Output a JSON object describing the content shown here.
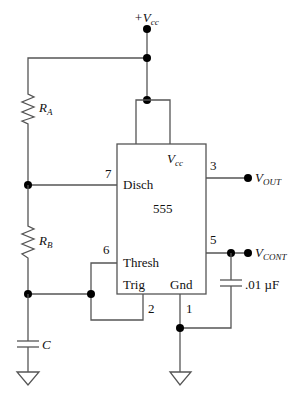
{
  "diagram": {
    "supply": {
      "label_prefix": "+V",
      "label_sub": "cc"
    },
    "chip": {
      "name": "555",
      "vcc_label": "V",
      "vcc_sub": "cc",
      "pins": {
        "disch": {
          "number": "7",
          "label": "Disch"
        },
        "thresh": {
          "number": "6",
          "label": "Thresh"
        },
        "trig": {
          "number": "2",
          "label": "Trig"
        },
        "gnd": {
          "number": "1",
          "label": "Gnd"
        },
        "out": {
          "number": "3"
        },
        "cont": {
          "number": "5"
        }
      }
    },
    "components": {
      "ra": {
        "label": "R",
        "sub": "A"
      },
      "rb": {
        "label": "R",
        "sub": "B"
      },
      "c": {
        "label": "C"
      },
      "ccont": {
        "label": ".01 µF"
      }
    },
    "outputs": {
      "vout": {
        "label": "V",
        "sub": "OUT"
      },
      "vcont": {
        "label": "V",
        "sub": "CONT"
      }
    },
    "colors": {
      "wire": "#555555",
      "node": "#000000",
      "text": "#111111"
    }
  }
}
